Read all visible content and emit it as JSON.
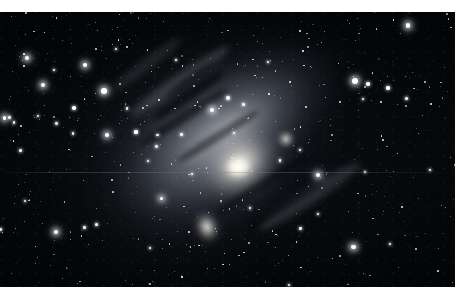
{
  "page": {
    "background_color": "#ffffff",
    "width": 468,
    "height": 300
  },
  "photo": {
    "name": "andromeda-galaxy-photograph",
    "alt_text": "Andromeda Galaxy M31 with companion galaxies in a dense star field",
    "subject": "Andromeda Galaxy (M31)",
    "medium": "monochrome long-exposure astrophotograph",
    "frame": {
      "x": 0,
      "y": 12,
      "width": 455,
      "height": 275
    },
    "background_color": "#050608",
    "caption": ""
  },
  "objects": [
    {
      "id": "m31",
      "label": "M31 Andromeda Galaxy",
      "type": "spiral-galaxy",
      "core_x": 238,
      "core_y": 155,
      "position_angle_deg": -36,
      "core_color": "#fffdf6",
      "disk_color": "#b9bec8"
    },
    {
      "id": "m110",
      "label": "M110 (NGC 205)",
      "type": "elliptical-galaxy",
      "core_x": 207,
      "core_y": 215,
      "core_color": "#fcfaf4"
    },
    {
      "id": "m32",
      "label": "M32 (NGC 221)",
      "type": "elliptical-galaxy",
      "core_x": 286,
      "core_y": 127,
      "core_color": "#faf8f2"
    }
  ],
  "features": {
    "dust_lanes": 6,
    "spiral_arm_bands": 3,
    "scan_line_y": 172,
    "star_count": 520
  },
  "colors": {
    "sky": "#050608",
    "star": "#ffffff",
    "galaxy_halo": "#8e96a6",
    "paper": "#ffffff"
  }
}
